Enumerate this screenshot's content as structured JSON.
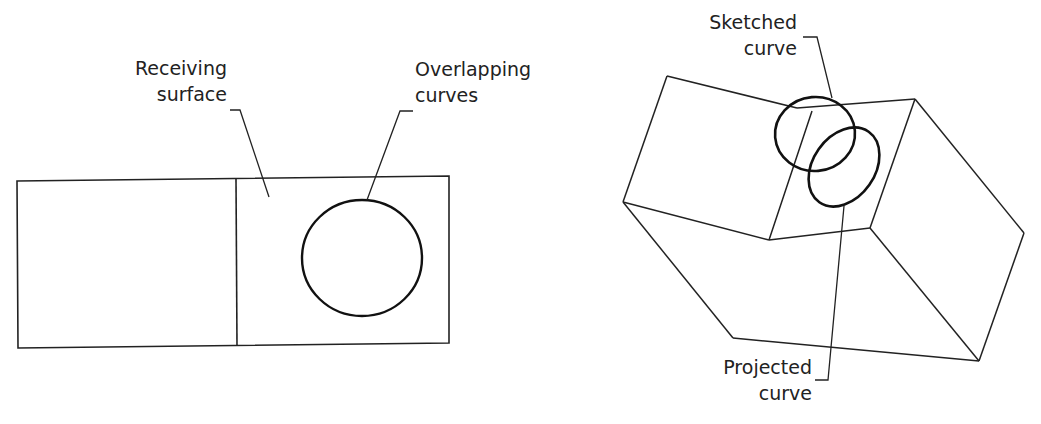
{
  "figure_left": {
    "title": "Overlapping curves on receiving surface (top view)",
    "labels": {
      "receiving_surface": [
        "Receiving",
        "surface"
      ],
      "overlapping_curves": [
        "Overlapping",
        "curves"
      ]
    }
  },
  "figure_right": {
    "title": "Sketched curve projected onto folded surface (isometric view)",
    "labels": {
      "sketched_curve": [
        "Sketched",
        "curve"
      ],
      "projected_curve": [
        "Projected",
        "curve"
      ]
    }
  },
  "colors": {
    "line": "#222222",
    "curve": "#111111",
    "background": "#ffffff"
  }
}
